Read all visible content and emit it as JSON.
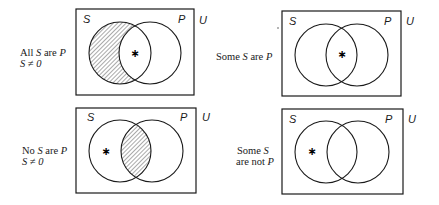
{
  "diagrams": [
    {
      "id": "all-s-are-p",
      "caption_lines": [
        "All S are P",
        "S ≠ 0"
      ],
      "box": {
        "x": 76,
        "y": 9,
        "w": 118,
        "h": 86
      },
      "circle_s": {
        "cx": 120,
        "cy": 53,
        "r": 31
      },
      "circle_p": {
        "cx": 150,
        "cy": 53,
        "r": 31
      },
      "shaded_region": "S-only",
      "star": {
        "x": 134,
        "y": 53,
        "region": "S-and-P"
      },
      "labels": {
        "s": "S",
        "p": "P",
        "u": "U"
      }
    },
    {
      "id": "some-s-are-p",
      "caption_lines": [
        "Some S are P"
      ],
      "box": {
        "x": 282,
        "y": 11,
        "w": 119,
        "h": 85
      },
      "circle_s": {
        "cx": 326,
        "cy": 55,
        "r": 31
      },
      "circle_p": {
        "cx": 357,
        "cy": 55,
        "r": 31
      },
      "shaded_region": "none",
      "star": {
        "x": 341,
        "y": 54,
        "region": "S-and-P"
      },
      "labels": {
        "s": "S",
        "p": "P",
        "u": "U"
      }
    },
    {
      "id": "no-s-are-p",
      "caption_lines": [
        "No S are P",
        "S ≠ 0"
      ],
      "box": {
        "x": 76,
        "y": 108,
        "w": 120,
        "h": 85
      },
      "circle_s": {
        "cx": 120,
        "cy": 151,
        "r": 31
      },
      "circle_p": {
        "cx": 152,
        "cy": 151,
        "r": 31
      },
      "shaded_region": "S-and-P",
      "star": {
        "x": 105,
        "y": 151,
        "region": "S-only"
      },
      "labels": {
        "s": "S",
        "p": "P",
        "u": "U"
      }
    },
    {
      "id": "some-s-are-not-p",
      "caption_lines": [
        "Some S",
        "are not P"
      ],
      "box": {
        "x": 282,
        "y": 109,
        "w": 121,
        "h": 85
      },
      "circle_s": {
        "cx": 326,
        "cy": 152,
        "r": 31
      },
      "circle_p": {
        "cx": 358,
        "cy": 152,
        "r": 31
      },
      "shaded_region": "none",
      "star": {
        "x": 311,
        "y": 151,
        "region": "S-only"
      },
      "labels": {
        "s": "S",
        "p": "P",
        "u": "U"
      }
    }
  ],
  "captions": {
    "d1": {
      "l1a": "All ",
      "l1b": "S",
      "l1c": " are ",
      "l1d": "P",
      "l2a": "S",
      "l2b": " ≠ ",
      "l2c": "0"
    },
    "d2": {
      "l1a": "Some ",
      "l1b": "S",
      "l1c": " are ",
      "l1d": "P"
    },
    "d3": {
      "l1a": "No ",
      "l1b": "S",
      "l1c": " are ",
      "l1d": "P",
      "l2a": "S",
      "l2b": " ≠ ",
      "l2c": "0"
    },
    "d4": {
      "l1a": "Some ",
      "l1b": "S",
      "l2a": "are not ",
      "l2b": "P"
    }
  },
  "set_labels": {
    "s": "S",
    "p": "P",
    "u": "U"
  },
  "marker": "∗",
  "colors": {
    "stroke": "#1a1a1a",
    "background": "#ffffff"
  }
}
